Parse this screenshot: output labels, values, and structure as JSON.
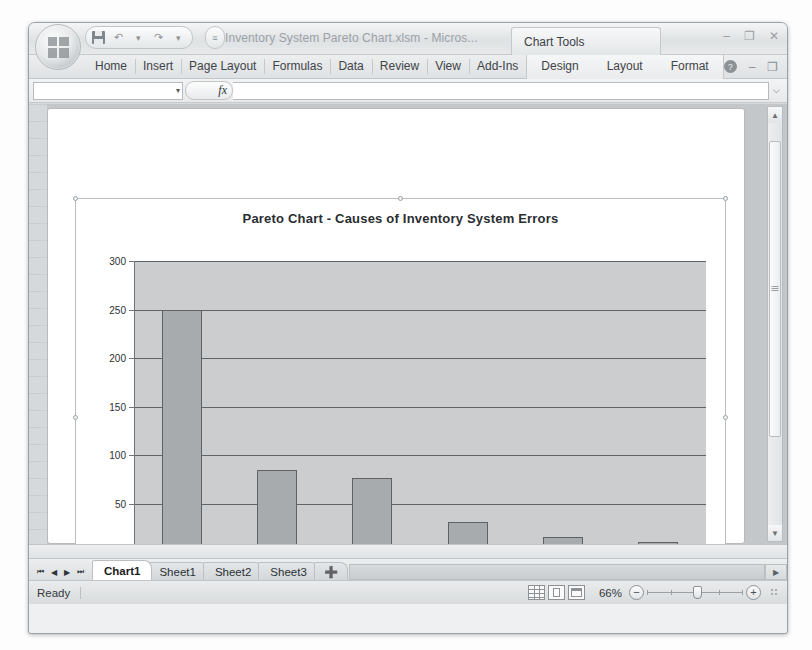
{
  "window": {
    "title": "Inventory System Pareto Chart.xlsm - Micros...",
    "contextual_tools_label": "Chart Tools",
    "minimize": "–",
    "restore": "❐",
    "close": "✕"
  },
  "quick_access": {
    "save_tooltip": "Save",
    "undo": "↶",
    "redo": "↷",
    "dropdown": "▾",
    "customize": "≡"
  },
  "ribbon": {
    "tabs": [
      {
        "label": "Home"
      },
      {
        "label": "Insert"
      },
      {
        "label": "Page Layout"
      },
      {
        "label": "Formulas"
      },
      {
        "label": "Data"
      },
      {
        "label": "Review"
      },
      {
        "label": "View"
      },
      {
        "label": "Add-Ins"
      }
    ],
    "contextual_tabs": [
      {
        "label": "Design"
      },
      {
        "label": "Layout"
      },
      {
        "label": "Format"
      }
    ],
    "help_glyph": "?",
    "minimize_ribbon": "–",
    "restore_ribbon": "❐",
    "close_ribbon": "✕"
  },
  "formula_bar": {
    "name_box_value": "",
    "name_box_caret": "▾",
    "fx_label": "fx",
    "formula_value": "",
    "expand_glyph": "⌵"
  },
  "chart_data": {
    "type": "bar",
    "title": "Pareto Chart - Causes of Inventory  System Errors",
    "xlabel": "",
    "ylabel": "",
    "ylim": [
      0,
      300
    ],
    "yticks": [
      300,
      250,
      200,
      150,
      100,
      50,
      0
    ],
    "grid": true,
    "legend": false,
    "categories": [
      "Inproper part number",
      "Invalid codes",
      "Out-of-date part number",
      "Address correction needed",
      "Exceeds maximum level",
      "Inactive supplier"
    ],
    "values": [
      250,
      85,
      77,
      32,
      16,
      11
    ],
    "bar_color": "#a8abad",
    "plot_background": "#cbcdcf"
  },
  "sheet_tabs": {
    "nav_first": "⏮",
    "nav_prev": "◀",
    "nav_next": "▶",
    "nav_last": "⏭",
    "tabs": [
      {
        "label": "Chart1",
        "active": true
      },
      {
        "label": "Sheet1",
        "active": false
      },
      {
        "label": "Sheet2",
        "active": false
      },
      {
        "label": "Sheet3",
        "active": false
      }
    ],
    "new_sheet_glyph": "➕",
    "scroll_right_glyph": "▶"
  },
  "status_bar": {
    "status_text": "Ready",
    "view_buttons": [
      "Normal",
      "Page Layout",
      "Page Break Preview"
    ],
    "zoom_percent": "66%",
    "zoom_out": "−",
    "zoom_in": "+"
  },
  "scrollbars": {
    "up_arrow": "▲",
    "down_arrow": "▼",
    "right_arrow": "▶"
  },
  "chart_object": {
    "resize_dots": "••••"
  }
}
